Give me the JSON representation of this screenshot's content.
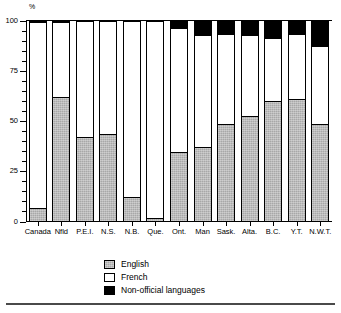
{
  "chart_data": {
    "type": "bar",
    "subtype": "stacked-100-percent",
    "title": "",
    "xlabel": "",
    "ylabel": "%",
    "unit_label": "%",
    "ylim": [
      0,
      100
    ],
    "yticks": [
      0,
      25,
      50,
      75,
      100
    ],
    "ytick_labels": [
      "0",
      "25",
      "50",
      "75",
      "100"
    ],
    "minor_tick_interval": 5,
    "grid": false,
    "legend_position": "bottom-center",
    "categories": [
      "Canada",
      "Nfld",
      "P.E.I.",
      "N.S.",
      "N.B.",
      "Que.",
      "Ont.",
      "Man",
      "Sask.",
      "Alta.",
      "B.C.",
      "Y.T.",
      "N.W.T."
    ],
    "series": [
      {
        "name": "English",
        "color": "#a8a8a8",
        "values": [
          7,
          62,
          42.5,
          44,
          12.5,
          2,
          35,
          37.5,
          49,
          52.5,
          60,
          61,
          49
        ]
      },
      {
        "name": "French",
        "color": "#ffffff",
        "values": [
          92,
          37,
          57,
          55.5,
          87,
          97.5,
          61,
          55,
          44,
          40,
          31,
          32,
          38
        ]
      },
      {
        "name": "Non-official languages",
        "color": "#000000",
        "values": [
          1,
          1,
          0.5,
          0.5,
          0.5,
          0.5,
          4,
          7.5,
          7,
          7.5,
          9,
          7,
          13
        ]
      }
    ]
  },
  "legend": {
    "items": [
      {
        "label": "English",
        "swatch": "english-swatch"
      },
      {
        "label": "French",
        "swatch": "french-swatch"
      },
      {
        "label": "Non-official languages",
        "swatch": "nonofficial-swatch"
      }
    ]
  }
}
